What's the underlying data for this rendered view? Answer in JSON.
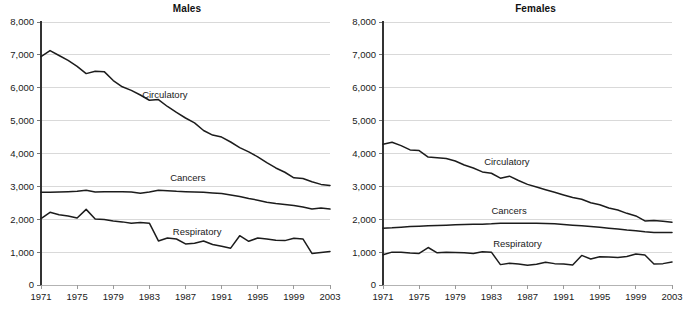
{
  "figure": {
    "width": 695,
    "height": 312,
    "background": "#ffffff",
    "line_color": "#1c1c1c",
    "grid_color": "#d9d9d9",
    "axis_color": "#333333"
  },
  "panels": [
    {
      "id": "males",
      "title": "Males"
    },
    {
      "id": "females",
      "title": "Females"
    }
  ],
  "chart_data": [
    {
      "type": "line",
      "title": "Males",
      "xlabel": "",
      "ylabel": "",
      "grid": true,
      "legend": "inline-labels",
      "xlim": [
        1971,
        2003
      ],
      "ylim": [
        0,
        8000
      ],
      "yticks": [
        0,
        1000,
        2000,
        3000,
        4000,
        5000,
        6000,
        7000,
        8000
      ],
      "ytick_labels": [
        "0",
        "1,000",
        "2,000",
        "3,000",
        "4,000",
        "5,000",
        "6,000",
        "7,000",
        "8,000"
      ],
      "xticks": [
        1971,
        1975,
        1979,
        1983,
        1987,
        1991,
        1995,
        1999,
        2003
      ],
      "xtick_labels": [
        "1971",
        "1975",
        "1979",
        "1983",
        "1987",
        "1991",
        "1995",
        "1999",
        "2003"
      ],
      "x": [
        1971,
        1972,
        1973,
        1974,
        1975,
        1976,
        1977,
        1978,
        1979,
        1980,
        1981,
        1982,
        1983,
        1984,
        1985,
        1986,
        1987,
        1988,
        1989,
        1990,
        1991,
        1992,
        1993,
        1994,
        1995,
        1996,
        1997,
        1998,
        1999,
        2000,
        2001,
        2002,
        2003
      ],
      "series": [
        {
          "name": "Circulatory",
          "label_x": 1982.2,
          "label_y": 5680,
          "values": [
            6950,
            7130,
            6980,
            6830,
            6650,
            6430,
            6500,
            6490,
            6220,
            6030,
            5920,
            5780,
            5620,
            5640,
            5430,
            5250,
            5080,
            4930,
            4700,
            4560,
            4500,
            4350,
            4180,
            4050,
            3900,
            3720,
            3560,
            3430,
            3260,
            3240,
            3140,
            3060,
            3030
          ]
        },
        {
          "name": "Cancers",
          "label_x": 1985.3,
          "label_y": 3160,
          "values": [
            2820,
            2820,
            2830,
            2840,
            2850,
            2880,
            2830,
            2840,
            2840,
            2840,
            2830,
            2790,
            2830,
            2880,
            2870,
            2850,
            2840,
            2830,
            2820,
            2800,
            2780,
            2740,
            2690,
            2630,
            2580,
            2520,
            2480,
            2450,
            2420,
            2370,
            2310,
            2340,
            2310
          ]
        },
        {
          "name": "Respiratory",
          "label_x": 1985.6,
          "label_y": 1530,
          "values": [
            2020,
            2210,
            2140,
            2100,
            2040,
            2300,
            2010,
            1990,
            1950,
            1920,
            1880,
            1900,
            1880,
            1340,
            1430,
            1400,
            1250,
            1270,
            1340,
            1230,
            1180,
            1120,
            1500,
            1330,
            1430,
            1400,
            1360,
            1350,
            1420,
            1400,
            960,
            990,
            1020
          ]
        }
      ]
    },
    {
      "type": "line",
      "title": "Females",
      "xlabel": "",
      "ylabel": "",
      "grid": true,
      "legend": "inline-labels",
      "xlim": [
        1971,
        2003
      ],
      "ylim": [
        0,
        8000
      ],
      "yticks": [
        0,
        1000,
        2000,
        3000,
        4000,
        5000,
        6000,
        7000,
        8000
      ],
      "ytick_labels": [
        "0",
        "1,000",
        "2,000",
        "3,000",
        "4,000",
        "5,000",
        "6,000",
        "7,000",
        "8,000"
      ],
      "xticks": [
        1971,
        1975,
        1979,
        1983,
        1987,
        1991,
        1995,
        1999,
        2003
      ],
      "xtick_labels": [
        "1971",
        "1975",
        "1979",
        "1983",
        "1987",
        "1991",
        "1995",
        "1999",
        "2003"
      ],
      "x": [
        1971,
        1972,
        1973,
        1974,
        1975,
        1976,
        1977,
        1978,
        1979,
        1980,
        1981,
        1982,
        1983,
        1984,
        1985,
        1986,
        1987,
        1988,
        1989,
        1990,
        1991,
        1992,
        1993,
        1994,
        1995,
        1996,
        1997,
        1998,
        1999,
        2000,
        2001,
        2002,
        2003
      ],
      "series": [
        {
          "name": "Circulatory",
          "label_x": 1982.2,
          "label_y": 3660,
          "values": [
            4280,
            4340,
            4240,
            4110,
            4090,
            3890,
            3870,
            3850,
            3770,
            3650,
            3560,
            3440,
            3400,
            3250,
            3310,
            3180,
            3060,
            2980,
            2900,
            2820,
            2740,
            2660,
            2610,
            2500,
            2440,
            2340,
            2280,
            2180,
            2100,
            1950,
            1960,
            1940,
            1910
          ]
        },
        {
          "name": "Cancers",
          "label_x": 1983.0,
          "label_y": 2160,
          "values": [
            1730,
            1740,
            1760,
            1780,
            1790,
            1800,
            1810,
            1820,
            1830,
            1840,
            1850,
            1850,
            1860,
            1880,
            1880,
            1880,
            1880,
            1880,
            1870,
            1860,
            1840,
            1820,
            1800,
            1780,
            1760,
            1730,
            1700,
            1670,
            1650,
            1620,
            1600,
            1600,
            1600
          ]
        },
        {
          "name": "Respiratory",
          "label_x": 1983.2,
          "label_y": 1150,
          "values": [
            920,
            1000,
            1000,
            970,
            960,
            1140,
            980,
            1000,
            990,
            980,
            960,
            1010,
            1000,
            620,
            660,
            640,
            600,
            630,
            690,
            650,
            640,
            610,
            900,
            790,
            860,
            850,
            840,
            870,
            940,
            910,
            640,
            650,
            700
          ]
        }
      ]
    }
  ]
}
